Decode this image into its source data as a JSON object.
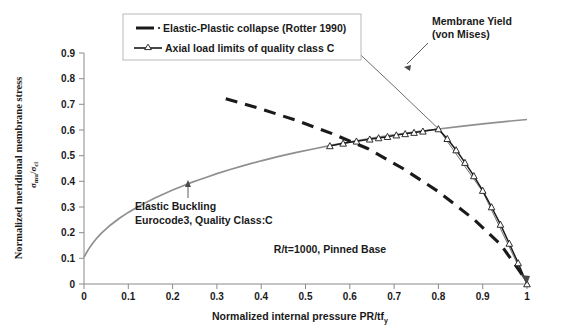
{
  "chart_data": {
    "type": "line",
    "title": "",
    "xlabel": "Normalized internal pressure PR/tf",
    "xlabel_sub": "y",
    "ylabel": "Normalized meridional membrane stress",
    "ylabel_sub_num": "mu",
    "ylabel_sub_den": "cl",
    "ylabel_sigma": "σ",
    "ylabel_slash": "/",
    "xlim": [
      0,
      1
    ],
    "ylim": [
      0,
      0.9
    ],
    "xticks": [
      "0",
      "0.1",
      "0.2",
      "0.3",
      "0.4",
      "0.5",
      "0.6",
      "0.7",
      "0.8",
      "0.9",
      "1"
    ],
    "yticks": [
      "0",
      "0.1",
      "0.2",
      "0.3",
      "0.4",
      "0.5",
      "0.6",
      "0.7",
      "0.8",
      "0.9"
    ],
    "grid": false,
    "legend_position": "top-center",
    "series": [
      {
        "name": "Elastic Buckling Eurocode3, Quality Class:C",
        "style": "solid-gray",
        "points": [
          [
            0.0,
            0.105
          ],
          [
            0.01,
            0.135
          ],
          [
            0.02,
            0.16
          ],
          [
            0.03,
            0.181
          ],
          [
            0.04,
            0.199
          ],
          [
            0.05,
            0.215
          ],
          [
            0.06,
            0.23
          ],
          [
            0.08,
            0.256
          ],
          [
            0.1,
            0.279
          ],
          [
            0.12,
            0.299
          ],
          [
            0.14,
            0.318
          ],
          [
            0.16,
            0.335
          ],
          [
            0.18,
            0.351
          ],
          [
            0.2,
            0.366
          ],
          [
            0.22,
            0.38
          ],
          [
            0.24,
            0.394
          ],
          [
            0.26,
            0.406
          ],
          [
            0.28,
            0.418
          ],
          [
            0.3,
            0.43
          ],
          [
            0.33,
            0.446
          ],
          [
            0.36,
            0.461
          ],
          [
            0.4,
            0.48
          ],
          [
            0.44,
            0.497
          ],
          [
            0.48,
            0.513
          ],
          [
            0.52,
            0.527
          ],
          [
            0.56,
            0.541
          ],
          [
            0.6,
            0.553
          ],
          [
            0.65,
            0.568
          ],
          [
            0.7,
            0.581
          ],
          [
            0.75,
            0.593
          ],
          [
            0.8,
            0.604
          ],
          [
            0.85,
            0.614
          ],
          [
            0.9,
            0.624
          ],
          [
            0.95,
            0.633
          ],
          [
            1.0,
            0.641
          ]
        ]
      },
      {
        "name": "Elastic-Plastic collapse (Rotter 1990)",
        "style": "dashed-black",
        "points": [
          [
            0.32,
            0.722
          ],
          [
            0.4,
            0.682
          ],
          [
            0.48,
            0.637
          ],
          [
            0.56,
            0.586
          ],
          [
            0.64,
            0.528
          ],
          [
            0.72,
            0.45
          ],
          [
            0.8,
            0.36
          ],
          [
            0.88,
            0.252
          ],
          [
            0.94,
            0.155
          ],
          [
            1.0,
            0.01
          ]
        ]
      },
      {
        "name": "Membrane Yield (von Mises)",
        "style": "thin-black",
        "points": [
          [
            0.62,
            0.9
          ],
          [
            0.7,
            0.77
          ],
          [
            0.8,
            0.605
          ],
          [
            0.9,
            0.36
          ],
          [
            1.0,
            0.0
          ]
        ]
      },
      {
        "name": "Axial load limits of quality class C",
        "style": "marker-triangle",
        "points": [
          [
            0.555,
            0.538
          ],
          [
            0.585,
            0.548
          ],
          [
            0.615,
            0.556
          ],
          [
            0.645,
            0.564
          ],
          [
            0.665,
            0.569
          ],
          [
            0.685,
            0.574
          ],
          [
            0.705,
            0.58
          ],
          [
            0.725,
            0.585
          ],
          [
            0.745,
            0.59
          ],
          [
            0.765,
            0.595
          ],
          [
            0.8,
            0.604
          ],
          [
            0.82,
            0.566
          ],
          [
            0.84,
            0.522
          ],
          [
            0.86,
            0.473
          ],
          [
            0.88,
            0.421
          ],
          [
            0.9,
            0.364
          ],
          [
            0.92,
            0.3
          ],
          [
            0.94,
            0.232
          ],
          [
            0.96,
            0.158
          ],
          [
            0.98,
            0.082
          ],
          [
            1.0,
            0.0
          ]
        ]
      }
    ],
    "legend": [
      {
        "label": "Elastic-Plastic collapse (Rotter 1990)",
        "marker": "dashed-line"
      },
      {
        "label": "Axial load limits of quality class C",
        "marker": "line-with-triangle"
      }
    ],
    "annotations": [
      {
        "id": "membrane-yield",
        "line1": "Membrane Yield",
        "line2": "(von Mises)"
      },
      {
        "id": "elastic-buckling",
        "line1": "Elastic Buckling",
        "line2": "Eurocode3, Quality Class:C"
      },
      {
        "id": "geometry-note",
        "line1": "R/t=1000, Pinned Base"
      }
    ]
  }
}
